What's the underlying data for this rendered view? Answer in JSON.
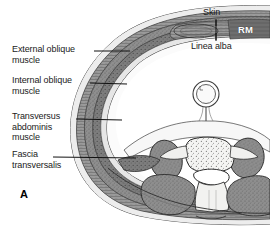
{
  "figure": {
    "panel_id": "A"
  },
  "labels_left": [
    {
      "name": "external-oblique",
      "text": "External oblique\nmuscle",
      "x": 12,
      "y": 46,
      "leader": {
        "x1": 94,
        "y1": 51,
        "x2": 130,
        "y2": 51
      }
    },
    {
      "name": "internal-oblique",
      "text": "Internal oblique\nmuscle",
      "x": 12,
      "y": 77,
      "leader": {
        "x1": 90,
        "y1": 82,
        "x2": 127,
        "y2": 84
      }
    },
    {
      "name": "transversus-abdominis",
      "text": "Transversus\nabdominis\nmuscle",
      "x": 12,
      "y": 113,
      "leader": {
        "x1": 76,
        "y1": 118,
        "x2": 122,
        "y2": 120
      }
    },
    {
      "name": "fascia-transversalis",
      "text": "Fascia\ntransversalis",
      "x": 12,
      "y": 151,
      "leader": {
        "x1": 53,
        "y1": 156,
        "x2": 136,
        "y2": 158
      }
    }
  ],
  "labels_top": [
    {
      "name": "skin",
      "text": "Skin",
      "x": 205,
      "y": 9,
      "leader": {
        "x1": 216,
        "y1": 19,
        "x2": 216,
        "y2": 37
      }
    },
    {
      "name": "linea-alba",
      "text": "Linea alba",
      "x": 193,
      "y": 41,
      "leader": {
        "x1": 216,
        "y1": 30,
        "x2": 216,
        "y2": 41
      }
    }
  ],
  "overlay_tags": [
    {
      "name": "rectus-muscle-rm",
      "text": "RM",
      "x": 238,
      "y": 27
    }
  ],
  "colors": {
    "background": "#ffffff",
    "muscle_fill": "#8e8e8e",
    "muscle_dark": "#6f6f6f",
    "fascia_line": "#3a3a3a",
    "bone_fill": "#f2f2f0",
    "cavity": "#ffffff",
    "label_text": "#1a1a1a",
    "rm_text": "#ffffff"
  }
}
